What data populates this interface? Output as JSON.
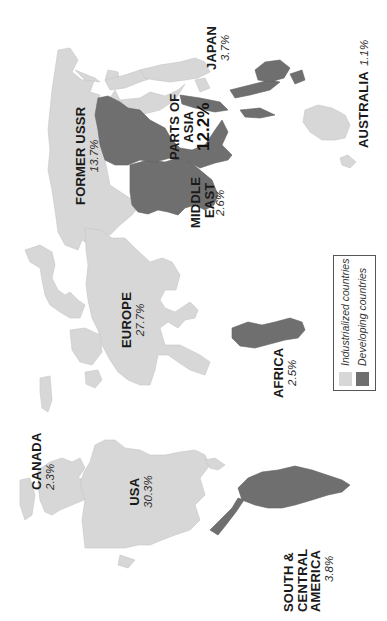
{
  "map": {
    "orientation": "rotated 90 degrees counter-clockwise",
    "colors": {
      "industrialized": "#d7d7d7",
      "developing": "#6f6f6f",
      "background": "#ffffff"
    },
    "regions": [
      {
        "id": "canada",
        "name": "CANADA",
        "share": "2.3%",
        "category": "Industrialized countries"
      },
      {
        "id": "usa",
        "name": "USA",
        "share": "30.3%",
        "category": "Industrialized countries"
      },
      {
        "id": "south_central_america",
        "name_lines": [
          "SOUTH &",
          "CENTRAL",
          "AMERICA"
        ],
        "share": "3.8%",
        "category": "Developing countries"
      },
      {
        "id": "europe",
        "name": "EUROPE",
        "share": "27.7%",
        "category": "Industrialized countries"
      },
      {
        "id": "africa",
        "name": "AFRICA",
        "share": "2.5%",
        "category": "Developing countries"
      },
      {
        "id": "former_ussr",
        "name": "FORMER USSR",
        "share": "13.7%",
        "category": "Industrialized countries"
      },
      {
        "id": "middle_east",
        "name_lines": [
          "MIDDLE",
          "EAST"
        ],
        "share": "2.6%",
        "category": "Developing countries"
      },
      {
        "id": "parts_of_asia",
        "name_lines": [
          "PARTS OF",
          "ASIA"
        ],
        "share": "12.2%",
        "category": "Developing countries"
      },
      {
        "id": "japan",
        "name": "JAPAN",
        "share": "3.7%",
        "category": "Industrialized countries"
      },
      {
        "id": "australia",
        "name": "AUSTRALIA",
        "share": "1.1%",
        "category": "Industrialized countries"
      }
    ]
  },
  "legend": {
    "items": [
      {
        "label": "Industrialized countries",
        "color": "#d7d7d7"
      },
      {
        "label": "Developing countries",
        "color": "#6f6f6f"
      }
    ]
  }
}
